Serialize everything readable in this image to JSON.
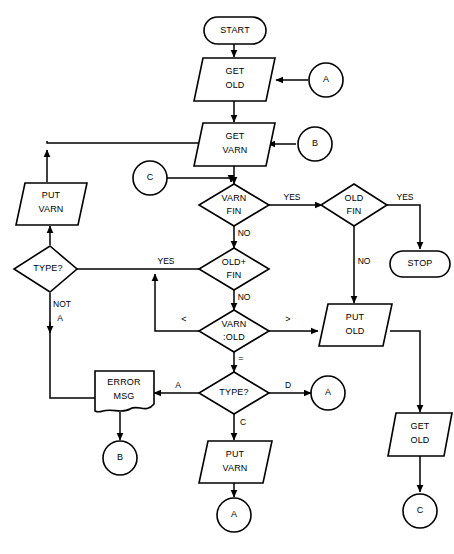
{
  "diagram": {
    "type": "flowchart",
    "background_color": "#ffffff",
    "line_color": "#000000",
    "shape_fill": "#ffffff"
  },
  "nodes": {
    "start": {
      "label": "START",
      "shape": "terminator"
    },
    "get_old_1": {
      "label_line1": "GET",
      "label_line2": "OLD",
      "shape": "parallelogram-io"
    },
    "conn_a_top": {
      "label": "A",
      "shape": "connector-circle"
    },
    "get_varn": {
      "label_line1": "GET",
      "label_line2": "VARN",
      "shape": "parallelogram-io"
    },
    "conn_b_right": {
      "label": "B",
      "shape": "connector-circle"
    },
    "conn_c_left": {
      "label": "C",
      "shape": "connector-circle"
    },
    "varn_fin": {
      "label_line1": "VARN",
      "label_line2": "FIN",
      "shape": "decision"
    },
    "old_fin": {
      "label_line1": "OLD",
      "label_line2": "FIN",
      "shape": "decision"
    },
    "stop": {
      "label": "STOP",
      "shape": "terminator"
    },
    "put_varn_left": {
      "label_line1": "PUT",
      "label_line2": "VARN",
      "shape": "parallelogram-io"
    },
    "type_left": {
      "label": "TYPE?",
      "shape": "decision"
    },
    "old_plus_fin": {
      "label_line1": "OLD+",
      "label_line2": "FIN",
      "shape": "decision"
    },
    "varn_old": {
      "label_line1": "VARN",
      "label_line2": ":OLD",
      "shape": "decision"
    },
    "put_old": {
      "label_line1": "PUT",
      "label_line2": "OLD",
      "shape": "parallelogram-io"
    },
    "get_old_2": {
      "label_line1": "GET",
      "label_line2": "OLD",
      "shape": "parallelogram-io"
    },
    "conn_c_bottom": {
      "label": "C",
      "shape": "connector-circle"
    },
    "error_msg": {
      "label_line1": "ERROR",
      "label_line2": "MSG",
      "shape": "document"
    },
    "conn_b_bottom": {
      "label": "B",
      "shape": "connector-circle"
    },
    "type_bottom": {
      "label": "TYPE?",
      "shape": "decision"
    },
    "conn_a_right": {
      "label": "A",
      "shape": "connector-circle"
    },
    "put_varn_bottom": {
      "label_line1": "PUT",
      "label_line2": "VARN",
      "shape": "parallelogram-io"
    },
    "conn_a_bottom": {
      "label": "A",
      "shape": "connector-circle"
    }
  },
  "edge_labels": {
    "varn_fin_yes": "YES",
    "varn_fin_no": "NO",
    "old_fin_yes": "YES",
    "old_fin_no": "NO",
    "old_plus_fin_yes": "YES",
    "old_plus_fin_no": "NO",
    "varn_old_less": "<",
    "varn_old_greater": ">",
    "varn_old_equal": "=",
    "type_left_not_a_line1": "NOT",
    "type_left_not_a_line2": "A",
    "type_bottom_a": "A",
    "type_bottom_c": "C",
    "type_bottom_d": "D"
  }
}
